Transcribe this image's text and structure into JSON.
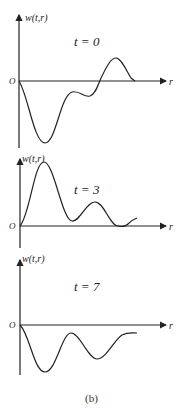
{
  "figure": {
    "caption": "(b)",
    "panels": [
      {
        "id": "t0",
        "time_label": "t = 0",
        "y_axis_label": "w(t,r)",
        "x_axis_label": "r",
        "origin_label": "O",
        "description": "Large negative dip near origin, small trough, then positive hump before returning to zero"
      },
      {
        "id": "t3",
        "time_label": "t = 3",
        "y_axis_label": "w(t,r)",
        "x_axis_label": "r",
        "origin_label": "O",
        "description": "Large positive peak near origin, smaller second peak, slight dip below zero at tail"
      },
      {
        "id": "t7",
        "time_label": "t = 7",
        "y_axis_label": "w(t,r)",
        "x_axis_label": "r",
        "origin_label": "O",
        "description": "Negative oscillation: deep trough, recovery, second trough, tail approaching zero from below"
      }
    ]
  },
  "colors": {
    "line": "#222222",
    "background": "#ffffff"
  }
}
